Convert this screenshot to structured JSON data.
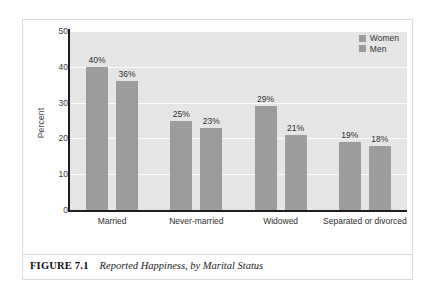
{
  "figure": {
    "caption_label": "FIGURE 7.1",
    "caption_title": "Reported Happiness, by Marital Status"
  },
  "chart_data": {
    "type": "bar",
    "title": "Reported Happiness, by Marital Status",
    "xlabel": "",
    "ylabel": "Percent",
    "ylim": [
      0,
      50
    ],
    "yticks": [
      0,
      10,
      20,
      30,
      40,
      50
    ],
    "grid": true,
    "legend_position": "top-right",
    "categories": [
      "Married",
      "Never-married",
      "Widowed",
      "Separated or divorced"
    ],
    "series": [
      {
        "name": "Women",
        "color": "#9c9c9c",
        "values": [
          40,
          25,
          29,
          19
        ],
        "labels": [
          "40%",
          "25%",
          "29%",
          "19%"
        ]
      },
      {
        "name": "Men",
        "color": "#9c9c9c",
        "values": [
          36,
          23,
          21,
          18
        ],
        "labels": [
          "36%",
          "23%",
          "21%",
          "18%"
        ]
      }
    ]
  }
}
